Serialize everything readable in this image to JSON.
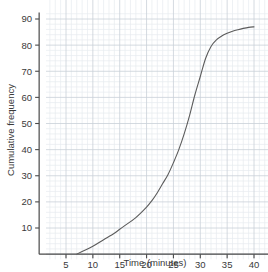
{
  "chart_data": {
    "type": "line",
    "title": "",
    "subtitle": "",
    "xlabel": "Time (minutes)",
    "ylabel": "Cumulative frequency",
    "xlim": [
      0,
      42
    ],
    "ylim": [
      0,
      93
    ],
    "xticks": [
      5,
      10,
      15,
      20,
      25,
      30,
      35,
      40
    ],
    "yticks": [
      10,
      20,
      30,
      40,
      50,
      60,
      70,
      80,
      90
    ],
    "xtick_labels": [
      "5",
      "10",
      "15",
      "20",
      "25",
      "30",
      "35",
      "40"
    ],
    "ytick_labels": [
      "10",
      "20",
      "30",
      "40",
      "50",
      "60",
      "70",
      "80",
      "90"
    ],
    "grid": true,
    "grid_major_x_step": 5,
    "grid_major_y_step": 10,
    "grid_minor_x_step": 1,
    "grid_minor_y_step": 2,
    "legend": "none",
    "series": [
      {
        "name": "Cumulative frequency",
        "color": "#5c5c5c",
        "x": [
          7,
          8,
          10,
          12,
          14,
          15,
          16,
          18,
          20,
          21,
          22,
          23,
          24,
          25,
          26,
          27,
          28,
          29,
          30,
          31,
          32,
          33,
          34,
          35,
          36,
          37,
          38,
          39,
          40
        ],
        "y": [
          0,
          1,
          3,
          5.5,
          8,
          9.5,
          11,
          14,
          18,
          20.5,
          23.5,
          27,
          30.5,
          35,
          40,
          46,
          53,
          61,
          68,
          75,
          79.5,
          82,
          83.5,
          84.5,
          85.3,
          85.9,
          86.4,
          86.8,
          87
        ]
      }
    ]
  },
  "colors": {
    "grid_major": "#c9d0d8",
    "grid_minor": "#e7ebef",
    "axis": "#4a4a4a",
    "curve": "#5c5c5c",
    "text": "#3a3a3a",
    "background": "#ffffff"
  }
}
